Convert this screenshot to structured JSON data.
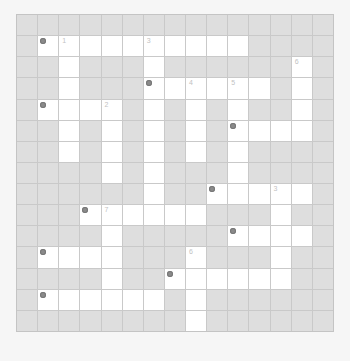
{
  "puzzle": {
    "rows": 15,
    "cols": 15,
    "colors": {
      "page_bg": "#f6f6f6",
      "blocked_cell": "#dedede",
      "open_cell": "#ffffff",
      "grid_line": "#c9c9c9",
      "marker": "#8a8a8a",
      "number": "#c2c2c2"
    },
    "open_cells": [
      [],
      [
        1,
        2,
        3,
        4,
        5,
        6,
        7,
        8,
        9,
        10
      ],
      [
        2,
        6,
        13
      ],
      [
        2,
        6,
        7,
        8,
        9,
        10,
        11,
        13
      ],
      [
        1,
        2,
        3,
        4,
        6,
        8,
        10,
        13
      ],
      [
        2,
        4,
        6,
        8,
        10,
        11,
        12,
        13
      ],
      [
        2,
        4,
        6,
        8,
        10
      ],
      [
        4,
        6,
        10
      ],
      [
        6,
        9,
        10,
        11,
        12,
        13
      ],
      [
        3,
        4,
        5,
        6,
        7,
        8,
        12
      ],
      [
        4,
        10,
        11,
        12,
        13
      ],
      [
        1,
        2,
        3,
        4,
        8,
        12
      ],
      [
        4,
        7,
        8,
        9,
        10,
        11,
        12
      ],
      [
        1,
        2,
        3,
        4,
        5,
        6,
        8
      ],
      [
        8
      ]
    ],
    "markers": [
      {
        "row": 1,
        "col": 1
      },
      {
        "row": 3,
        "col": 6
      },
      {
        "row": 4,
        "col": 1
      },
      {
        "row": 5,
        "col": 10
      },
      {
        "row": 8,
        "col": 9
      },
      {
        "row": 9,
        "col": 3
      },
      {
        "row": 10,
        "col": 10
      },
      {
        "row": 11,
        "col": 1
      },
      {
        "row": 12,
        "col": 7
      },
      {
        "row": 13,
        "col": 1
      }
    ],
    "numbers": [
      {
        "row": 1,
        "col": 2,
        "label": "1"
      },
      {
        "row": 1,
        "col": 6,
        "label": "3"
      },
      {
        "row": 2,
        "col": 13,
        "label": "6"
      },
      {
        "row": 3,
        "col": 8,
        "label": "4"
      },
      {
        "row": 3,
        "col": 10,
        "label": "5"
      },
      {
        "row": 4,
        "col": 4,
        "label": "2"
      },
      {
        "row": 8,
        "col": 12,
        "label": "3"
      },
      {
        "row": 9,
        "col": 4,
        "label": "7"
      },
      {
        "row": 11,
        "col": 8,
        "label": "6"
      }
    ]
  }
}
